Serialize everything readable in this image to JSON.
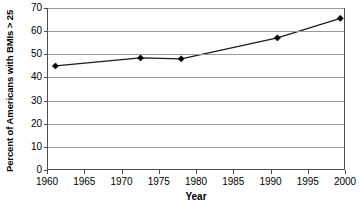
{
  "chart_data": {
    "type": "line",
    "title": "",
    "xlabel": "Year",
    "ylabel": "Percent of Americans with BMIs > 25",
    "xlim": [
      1960,
      2000
    ],
    "ylim": [
      0,
      70
    ],
    "xticks": [
      1960,
      1965,
      1970,
      1975,
      1980,
      1985,
      1990,
      1995,
      2000
    ],
    "xticklabels": [
      "1960",
      "1965",
      "1970",
      "1975",
      "1980",
      "1985",
      "1990",
      "1995",
      "2000"
    ],
    "yticks": [
      0,
      10,
      20,
      30,
      40,
      50,
      60,
      70
    ],
    "yticklabels": [
      "0",
      "10",
      "20",
      "30",
      "40",
      "50",
      "60",
      "70"
    ],
    "grid": "horizontal",
    "legend": "none",
    "marker": "diamond",
    "series": [
      {
        "name": "Percent of Americans with BMIs > 25",
        "x": [
          1961,
          1972.5,
          1978,
          1991,
          1999.5
        ],
        "values": [
          44.8,
          48.3,
          47.9,
          57.0,
          65.5
        ],
        "color": "#000000"
      }
    ],
    "colors": {
      "line": "#1a1a1a",
      "marker": "#000000",
      "gridline": "#9a9a9a",
      "axis": "#4d4d4d",
      "background": "#ffffff",
      "text": "#000000"
    }
  }
}
